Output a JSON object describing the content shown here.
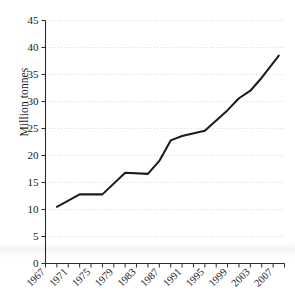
{
  "chart_data": {
    "type": "line",
    "title": "",
    "xlabel": "",
    "ylabel": "Million tonnes",
    "xlim": [
      1967,
      2009
    ],
    "ylim": [
      0,
      45
    ],
    "ytick_step": 5,
    "yticks": [
      0,
      5,
      10,
      15,
      20,
      25,
      30,
      35,
      40,
      45
    ],
    "ytick_labels": [
      "0",
      "5",
      "10",
      "15",
      "20",
      "25",
      "30",
      "35",
      "40",
      "45"
    ],
    "xticks": [
      1967,
      1969,
      1971,
      1973,
      1975,
      1977,
      1979,
      1981,
      1983,
      1985,
      1987,
      1989,
      1991,
      1993,
      1995,
      1997,
      1999,
      2001,
      2003,
      2005,
      2007,
      2009
    ],
    "xtick_labels": [
      "1967",
      "1971",
      "1975",
      "1979",
      "1983",
      "1987",
      "1991",
      "1995",
      "1999",
      "2003",
      "2007"
    ],
    "xtick_labeled_values": [
      1967,
      1971,
      1975,
      1979,
      1983,
      1987,
      1991,
      1995,
      1999,
      2003,
      2007
    ],
    "xtick_label_rotation": -45,
    "grid": "horizontal-dotted",
    "legend": "none",
    "series": [
      {
        "name": "Million tonnes",
        "color": "#1c1c1c",
        "x": [
          1969,
          1973,
          1977,
          1981,
          1985,
          1987,
          1989,
          1991,
          1995,
          1999,
          2001,
          2003,
          2005,
          2008
        ],
        "values": [
          10.5,
          12.8,
          12.8,
          16.8,
          16.6,
          19.0,
          22.8,
          23.6,
          24.6,
          28.4,
          30.6,
          32.0,
          34.4,
          38.5
        ]
      }
    ],
    "colors": {
      "line": "#1c1c1c",
      "grid": "#c9c9cf",
      "axis": "#2b2b2b",
      "background": "#ffffff",
      "text": "#1a1a1a"
    }
  }
}
